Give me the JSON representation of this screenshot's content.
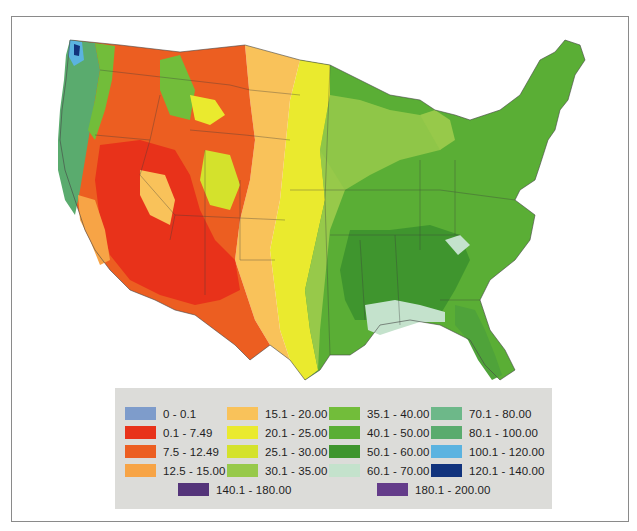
{
  "map": {
    "subject": "Contiguous United States choropleth",
    "regions": [
      {
        "name": "pacific-northwest-coast",
        "class_index": 14
      },
      {
        "name": "west-desert",
        "class_index": 1
      },
      {
        "name": "great-basin-mountains",
        "class_index": 2
      },
      {
        "name": "high-plains",
        "class_index": 3
      },
      {
        "name": "central-plains",
        "class_index": 5
      },
      {
        "name": "midwest",
        "class_index": 8
      },
      {
        "name": "east",
        "class_index": 9
      },
      {
        "name": "southeast",
        "class_index": 10
      },
      {
        "name": "gulf-coast",
        "class_index": 11
      }
    ]
  },
  "legend": {
    "items": [
      {
        "label": "0 - 0.1",
        "color": "#7e9ccb"
      },
      {
        "label": "0.1 - 7.49",
        "color": "#e8321a"
      },
      {
        "label": "7.5 - 12.49",
        "color": "#ec5e21"
      },
      {
        "label": "12.5 - 15.00",
        "color": "#f7a446"
      },
      {
        "label": "15.1 - 20.00",
        "color": "#f9c25a"
      },
      {
        "label": "20.1 - 25.00",
        "color": "#eaea2e"
      },
      {
        "label": "25.1 - 30.00",
        "color": "#d4e22c"
      },
      {
        "label": "30.1 - 35.00",
        "color": "#97c94a"
      },
      {
        "label": "35.1 - 40.00",
        "color": "#72bd3a"
      },
      {
        "label": "40.1 - 50.00",
        "color": "#5aae35"
      },
      {
        "label": "50.1 - 60.00",
        "color": "#3f952e"
      },
      {
        "label": "60.1 - 70.00",
        "color": "#c4e2cc"
      },
      {
        "label": "70.1 - 80.00",
        "color": "#6db889"
      },
      {
        "label": "80.1 - 100.00",
        "color": "#5aab6e"
      },
      {
        "label": "100.1 - 120.00",
        "color": "#5bb3e0"
      },
      {
        "label": "120.1 - 140.00",
        "color": "#11337d"
      },
      {
        "label": "140.1 - 180.00",
        "color": "#54347a"
      },
      {
        "label": "180.1 - 200.00",
        "color": "#643c8a"
      }
    ]
  }
}
